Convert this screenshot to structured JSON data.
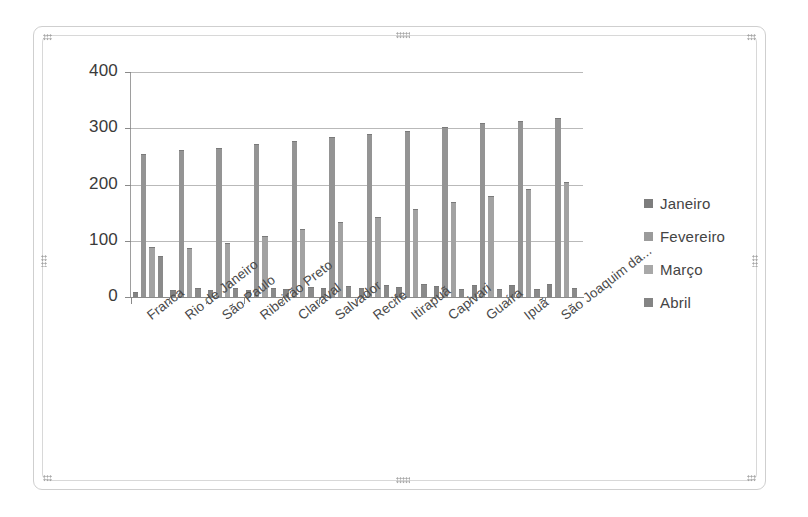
{
  "chart_object": {
    "selected": true,
    "handle_name": "resize-handle"
  },
  "legend": {
    "position": "right",
    "entries": [
      {
        "label": "Janeiro",
        "color": "#7d7d7d"
      },
      {
        "label": "Fevereiro",
        "color": "#9b9b9b"
      },
      {
        "label": "Março",
        "color": "#a8a8a8"
      },
      {
        "label": "Abril",
        "color": "#848484"
      }
    ]
  },
  "chart_data": {
    "type": "bar",
    "title": "",
    "xlabel": "",
    "ylabel": "",
    "ylim": [
      0,
      400
    ],
    "yticks": [
      0,
      100,
      200,
      300,
      400
    ],
    "grid": true,
    "legend_position": "right",
    "categories": [
      "Franca",
      "Rio de Janeiro",
      "São Paulo",
      "Ribeirão Preto",
      "Claraval",
      "Salvador",
      "Recife",
      "Itirapuã",
      "Capivari",
      "Guaíra",
      "Ipuã",
      "São Joaquim da..."
    ],
    "series": [
      {
        "name": "Janeiro",
        "values": [
          8,
          10,
          10,
          11,
          12,
          14,
          15,
          16,
          18,
          20,
          20,
          22
        ]
      },
      {
        "name": "Fevereiro",
        "values": [
          252,
          259,
          264,
          270,
          276,
          282,
          288,
          294,
          300,
          307,
          312,
          317
        ]
      },
      {
        "name": "Março",
        "values": [
          88,
          85,
          95,
          107,
          120,
          131,
          141,
          155,
          168,
          178,
          190,
          203
        ]
      },
      {
        "name": "Abril",
        "values": [
          72,
          14,
          14,
          15,
          16,
          18,
          20,
          22,
          12,
          12,
          13,
          14
        ]
      }
    ]
  }
}
